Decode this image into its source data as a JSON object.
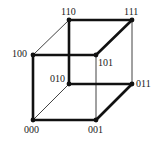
{
  "diagram": {
    "type": "hypercube-3d",
    "line_color": "#111111",
    "nodes": [
      {
        "id": "000",
        "label": "000",
        "x": 33,
        "y": 120,
        "lx": 24,
        "ly": 125
      },
      {
        "id": "001",
        "label": "001",
        "x": 96,
        "y": 120,
        "lx": 88,
        "ly": 125
      },
      {
        "id": "010",
        "label": "010",
        "x": 69,
        "y": 84,
        "lx": 50,
        "ly": 74
      },
      {
        "id": "011",
        "label": "011",
        "x": 132,
        "y": 84,
        "lx": 136,
        "ly": 79
      },
      {
        "id": "100",
        "label": "100",
        "x": 33,
        "y": 55,
        "lx": 12,
        "ly": 49
      },
      {
        "id": "101",
        "label": "101",
        "x": 96,
        "y": 55,
        "lx": 98,
        "ly": 58
      },
      {
        "id": "110",
        "label": "110",
        "x": 69,
        "y": 20,
        "lx": 61,
        "ly": 7
      },
      {
        "id": "111",
        "label": "111",
        "x": 132,
        "y": 20,
        "lx": 124,
        "ly": 7
      }
    ],
    "edges": [
      {
        "from": "000",
        "to": "001",
        "weight": "thick"
      },
      {
        "from": "000",
        "to": "100",
        "weight": "thick"
      },
      {
        "from": "000",
        "to": "010",
        "weight": "thin"
      },
      {
        "from": "001",
        "to": "011",
        "weight": "thick"
      },
      {
        "from": "001",
        "to": "101",
        "weight": "thin"
      },
      {
        "from": "010",
        "to": "011",
        "weight": "thick"
      },
      {
        "from": "010",
        "to": "110",
        "weight": "thick"
      },
      {
        "from": "011",
        "to": "111",
        "weight": "thin"
      },
      {
        "from": "100",
        "to": "101",
        "weight": "thick"
      },
      {
        "from": "100",
        "to": "110",
        "weight": "thin"
      },
      {
        "from": "101",
        "to": "111",
        "weight": "thick"
      },
      {
        "from": "110",
        "to": "111",
        "weight": "thick"
      }
    ]
  }
}
